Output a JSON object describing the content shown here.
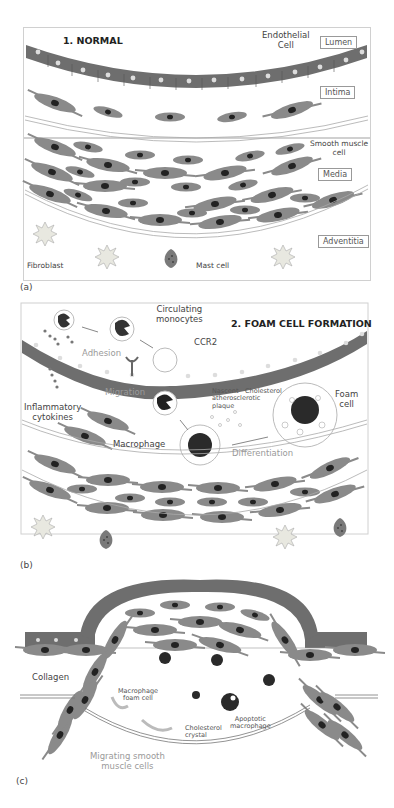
{
  "panels": {
    "a": {
      "tag": "(a)",
      "title": "1. NORMAL",
      "labels": {
        "endothelial": "Endothelial\nCell",
        "lumen": "Lumen",
        "intima": "Intima",
        "smooth_muscle": "Smooth muscle\ncell",
        "media": "Media",
        "adventitia": "Adventitia",
        "fibroblast": "Fibroblast",
        "mast_cell": "Mast cell"
      }
    },
    "b": {
      "tag": "(b)",
      "title": "2. FOAM CELL FORMATION",
      "labels": {
        "circulating": "Circulating\nmonocytes",
        "ccr2": "CCR2",
        "adhesion": "Adhesion",
        "migration": "Migration",
        "inflammatory": "Inflammatory\ncytokines",
        "nascent": "Nascent\natherosclerotic\nplaque",
        "cholesterol": "Cholesterol",
        "foam_cell": "Foam\ncell",
        "macrophage": "Macrophage",
        "differentiation": "Differentiation"
      }
    },
    "c": {
      "tag": "(c)",
      "labels": {
        "collagen": "Collagen",
        "macrophage_foam": "Macrophage\nfoam cell",
        "cholesterol_crystal": "Cholesterol\ncrystal",
        "apoptotic": "Apoptotic\nmacrophage",
        "migrating": "Migrating smooth\nmuscle cells"
      }
    }
  },
  "colors": {
    "endothelium": "#6e6e6e",
    "smc_body": "#8a8a8a",
    "nucleus": "#222222",
    "macrophage": "#2a2a2a",
    "frame": "#d0d0d0"
  }
}
